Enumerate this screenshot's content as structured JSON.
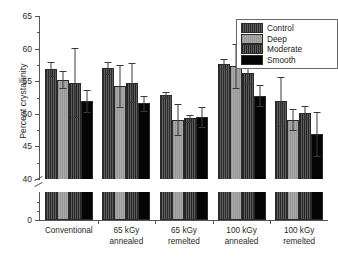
{
  "chart_data": {
    "type": "bar",
    "title": "",
    "xlabel": "",
    "ylabel": "Percent crystallinity",
    "ylim": [
      0,
      65
    ],
    "yticks": [
      0,
      40,
      45,
      50,
      55,
      60,
      65
    ],
    "axis_break": {
      "below": 40,
      "above": 0,
      "present": true
    },
    "grid": false,
    "legend_position": "top-right",
    "categories": [
      "Conventional",
      "65 kGy annealed",
      "65 kGy remelted",
      "100 kGy annealed",
      "100 kGy remelted"
    ],
    "category_lines": [
      [
        "Conventional",
        ""
      ],
      [
        "65 kGy",
        "annealed"
      ],
      [
        "65 kGy",
        "remelted"
      ],
      [
        "100 kGy",
        "annealed"
      ],
      [
        "100 kGy",
        "remelted"
      ]
    ],
    "series": [
      {
        "name": "Control",
        "color": "#4d4d4d",
        "pattern": "hatch-dark",
        "values": [
          56.9,
          57.0,
          52.9,
          57.6,
          51.9
        ],
        "errors": [
          1.1,
          0.9,
          0.5,
          0.8,
          3.7
        ]
      },
      {
        "name": "Deep",
        "color": "#a0a0a0",
        "pattern": "solid-light",
        "values": [
          55.2,
          54.3,
          49.1,
          57.3,
          49.1
        ],
        "errors": [
          1.3,
          3.2,
          2.4,
          3.4,
          1.6
        ]
      },
      {
        "name": "Moderate",
        "color": "#474747",
        "pattern": "hatch-dark",
        "values": [
          54.8,
          54.8,
          49.3,
          56.2,
          50.2
        ],
        "errors": [
          5.3,
          3.0,
          0.5,
          1.7,
          1.0
        ]
      },
      {
        "name": "Smooth",
        "color": "#050505",
        "pattern": "solid-black",
        "values": [
          52.0,
          51.6,
          49.5,
          52.8,
          46.9
        ],
        "errors": [
          1.7,
          1.1,
          1.5,
          1.6,
          3.3
        ]
      }
    ]
  },
  "legend": {
    "entries": [
      {
        "label": "Control"
      },
      {
        "label": "Deep"
      },
      {
        "label": "Moderate"
      },
      {
        "label": "Smooth"
      }
    ]
  }
}
